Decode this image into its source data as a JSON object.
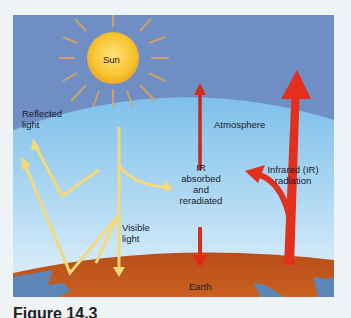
{
  "figure": {
    "labels": {
      "sun": "Sun",
      "reflected_light": [
        "Reflected",
        "light"
      ],
      "atmosphere": "Atmosphere",
      "ir_absorbed": [
        "IR",
        "absorbed",
        "and",
        "reradiated"
      ],
      "infrared_radiation": [
        "Infrared (IR)",
        "radiation"
      ],
      "visible_light": [
        "Visible",
        "light"
      ],
      "earth": "Earth"
    },
    "colors": {
      "space": "#6f8fc4",
      "atmosphere_top": "#7ec0ea",
      "atmosphere_bottom": "#dceefa",
      "sun": "#f7c531",
      "sun_rays": "#e0a25a",
      "visible_light_arrows": "#f5d878",
      "ir_arrows": "#e02a1a",
      "earth_land": "#c0561e",
      "earth_water": "#5a86b8"
    }
  },
  "caption": {
    "text": "Figure 14.3"
  }
}
